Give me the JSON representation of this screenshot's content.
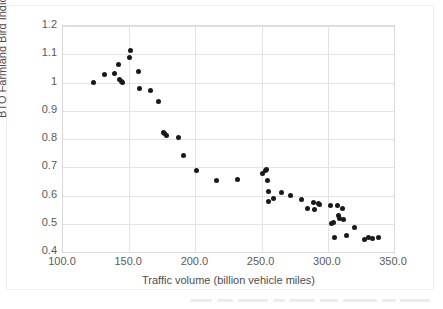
{
  "chart_data": {
    "type": "scatter",
    "title": "",
    "xlabel": "Traffic volume (billion vehicle miles)",
    "ylabel": "BTO Farmland Bird Indicator",
    "xlim": [
      100.0,
      350.0
    ],
    "ylim": [
      0.4,
      1.2
    ],
    "xticks": [
      100.0,
      150.0,
      200.0,
      250.0,
      300.0,
      350.0
    ],
    "xtick_labels": [
      "100.0",
      "150.0",
      "200.0",
      "250.0",
      "300.0",
      "350.0"
    ],
    "yticks": [
      0.4,
      0.5,
      0.6,
      0.7,
      0.8,
      0.9,
      1.0,
      1.1,
      1.2
    ],
    "ytick_labels": [
      "0.4",
      "0.5",
      "0.6",
      "0.7",
      "0.8",
      "0.9",
      "1",
      "1.1",
      "1.2"
    ],
    "grid": true,
    "legend": false,
    "marker_color": "#191919",
    "marker_size": 5,
    "series": [
      {
        "name": "BTO Farmland Bird Indicator vs traffic volume",
        "points": [
          [
            123.0,
            1.0
          ],
          [
            131.0,
            1.03
          ],
          [
            139.0,
            1.032
          ],
          [
            142.0,
            1.065
          ],
          [
            143.0,
            1.01
          ],
          [
            144.0,
            1.005
          ],
          [
            145.0,
            1.0
          ],
          [
            150.0,
            1.088
          ],
          [
            151.0,
            1.113
          ],
          [
            157.0,
            1.038
          ],
          [
            158.0,
            0.978
          ],
          [
            166.0,
            0.97
          ],
          [
            172.0,
            0.932
          ],
          [
            176.0,
            0.822
          ],
          [
            177.0,
            0.818
          ],
          [
            178.0,
            0.812
          ],
          [
            187.0,
            0.805
          ],
          [
            191.0,
            0.742
          ],
          [
            201.0,
            0.687
          ],
          [
            216.0,
            0.652
          ],
          [
            232.0,
            0.656
          ],
          [
            251.0,
            0.678
          ],
          [
            253.0,
            0.69
          ],
          [
            254.0,
            0.693
          ],
          [
            254.5,
            0.652
          ],
          [
            255.0,
            0.615
          ],
          [
            255.5,
            0.578
          ],
          [
            259.0,
            0.59
          ],
          [
            265.0,
            0.61
          ],
          [
            272.0,
            0.6
          ],
          [
            280.0,
            0.585
          ],
          [
            285.0,
            0.553
          ],
          [
            289.0,
            0.575
          ],
          [
            290.0,
            0.552
          ],
          [
            293.0,
            0.57
          ],
          [
            294.0,
            0.568
          ],
          [
            302.0,
            0.566
          ],
          [
            303.0,
            0.5
          ],
          [
            304.0,
            0.505
          ],
          [
            305.0,
            0.452
          ],
          [
            307.0,
            0.565
          ],
          [
            308.0,
            0.53
          ],
          [
            309.0,
            0.52
          ],
          [
            311.0,
            0.555
          ],
          [
            312.0,
            0.516
          ],
          [
            314.0,
            0.46
          ],
          [
            320.0,
            0.488
          ],
          [
            328.0,
            0.446
          ],
          [
            331.0,
            0.452
          ],
          [
            334.0,
            0.448
          ],
          [
            338.0,
            0.45
          ]
        ]
      }
    ]
  }
}
